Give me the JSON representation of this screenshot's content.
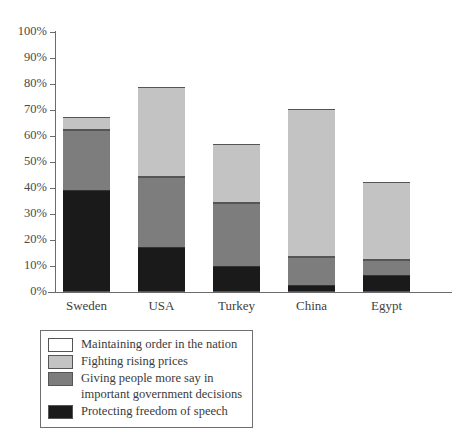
{
  "chart_data": {
    "type": "bar",
    "subtype": "stacked-percentage",
    "title": "",
    "xlabel": "",
    "ylabel": "",
    "ylim": [
      0,
      100
    ],
    "yunit": "%",
    "grid": false,
    "legend_position": "bottom-left",
    "categories": [
      "Sweden",
      "USA",
      "Turkey",
      "China",
      "Egypt"
    ],
    "yticks": [
      "0%",
      "10%",
      "20%",
      "30%",
      "40%",
      "50%",
      "60%",
      "70%",
      "80%",
      "90%",
      "100%"
    ],
    "ytick_values": [
      0,
      10,
      20,
      30,
      40,
      50,
      60,
      70,
      80,
      90,
      100
    ],
    "series": [
      {
        "name": "Protecting freedom of speech",
        "color": "#1a1a1a",
        "values": [
          39,
          17,
          9.5,
          2.5,
          6
        ]
      },
      {
        "name": "Giving people more say in important government decisions",
        "color": "#7d7d7d",
        "values": [
          23,
          27,
          24.5,
          10.5,
          6
        ]
      },
      {
        "name": "Fighting rising prices",
        "color": "#c3c3c3",
        "values": [
          5,
          34.5,
          22.5,
          57,
          30
        ]
      },
      {
        "name": "Maintaining order in the nation",
        "color": "#ffffff",
        "values": [
          33,
          21.5,
          43.5,
          30,
          58
        ]
      }
    ],
    "cumulative_tops": {
      "Sweden": [
        39,
        62,
        67,
        100
      ],
      "USA": [
        17,
        44,
        78.5,
        100
      ],
      "Turkey": [
        9.5,
        34,
        56.5,
        100
      ],
      "China": [
        2.5,
        13,
        70,
        100
      ],
      "Egypt": [
        6,
        12,
        42,
        100
      ]
    }
  },
  "legend": {
    "items": [
      {
        "swatch": "white",
        "line1": "Maintaining order in the nation",
        "line2": ""
      },
      {
        "swatch": "light",
        "line1": "Fighting rising prices",
        "line2": ""
      },
      {
        "swatch": "dark",
        "line1": "Giving people more say in",
        "line2": "important government decisions"
      },
      {
        "swatch": "black",
        "line1": "Protecting freedom of speech",
        "line2": ""
      }
    ]
  },
  "colors": {
    "white": "#ffffff",
    "light_gray": "#c3c3c3",
    "dark_gray": "#7d7d7d",
    "black": "#1a1a1a",
    "axis": "#6b6b6b",
    "outline": "#555555",
    "text": "#3a3a3a"
  }
}
